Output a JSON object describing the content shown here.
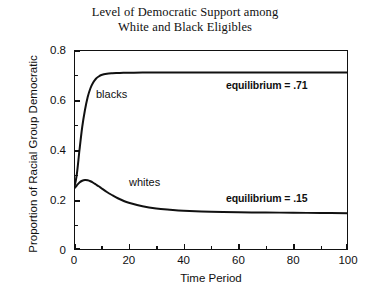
{
  "chart_data": {
    "type": "line",
    "title": "Level of Democratic Support among White and Black Eligibles",
    "title_lines": [
      "Level of Democratic Support among",
      "White and Black Eligibles"
    ],
    "xlabel": "Time Period",
    "ylabel": "Proportion of Racial Group Democratic",
    "xlim": [
      0,
      100
    ],
    "ylim": [
      0,
      0.8
    ],
    "grid": false,
    "legend_position": "inline-annotations",
    "x_ticks": [
      0,
      20,
      40,
      60,
      80,
      100
    ],
    "x_tick_labels": [
      "0",
      "20",
      "40",
      "60",
      "80",
      "100"
    ],
    "x_minor_ticks": [
      10,
      30,
      50,
      70,
      90
    ],
    "y_ticks": [
      0,
      0.2,
      0.4,
      0.6,
      0.8
    ],
    "y_tick_labels": [
      "0",
      "0.2",
      "0.4",
      "0.6",
      "0.8"
    ],
    "y_minor_ticks": [
      0.1,
      0.3,
      0.5,
      0.7
    ],
    "line_color": "#111111",
    "x": [
      0,
      1,
      2,
      3,
      4,
      5,
      6,
      7,
      8,
      9,
      10,
      12,
      14,
      16,
      18,
      20,
      25,
      30,
      35,
      40,
      50,
      60,
      70,
      80,
      90,
      100
    ],
    "series": [
      {
        "name": "blacks",
        "label": "blacks",
        "equilibrium": 0.71,
        "equilibrium_label": "equilibrium = .71",
        "values": [
          0.245,
          0.3,
          0.4,
          0.492,
          0.56,
          0.612,
          0.647,
          0.67,
          0.685,
          0.694,
          0.7,
          0.705,
          0.707,
          0.708,
          0.709,
          0.709,
          0.71,
          0.71,
          0.71,
          0.71,
          0.71,
          0.71,
          0.71,
          0.71,
          0.71,
          0.71
        ]
      },
      {
        "name": "whites",
        "label": "whites",
        "equilibrium": 0.15,
        "equilibrium_label": "equilibrium = .15",
        "values": [
          0.245,
          0.258,
          0.27,
          0.277,
          0.28,
          0.279,
          0.275,
          0.269,
          0.262,
          0.255,
          0.247,
          0.232,
          0.219,
          0.207,
          0.197,
          0.189,
          0.175,
          0.166,
          0.161,
          0.157,
          0.153,
          0.151,
          0.15,
          0.149,
          0.148,
          0.147
        ]
      }
    ],
    "annotations": [
      {
        "text": "blacks",
        "x": 9,
        "y": 0.62
      },
      {
        "text": "whites",
        "x": 21,
        "y": 0.245
      },
      {
        "text": "equilibrium = .71",
        "x": 84,
        "y": 0.655
      },
      {
        "text": "equilibrium = .15",
        "x": 84,
        "y": 0.205
      }
    ]
  }
}
